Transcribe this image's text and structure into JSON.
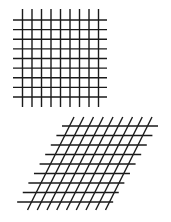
{
  "figure": {
    "panels": [
      {
        "id": "square-grid",
        "description": "orthogonal grid",
        "vertical_lines": 9,
        "horizontal_lines": 9,
        "line_color": "#1a1a1a"
      },
      {
        "id": "sheared-grid",
        "description": "sheared (slanted) grid",
        "slanted_lines": 9,
        "horizontal_lines": 9,
        "line_color": "#1a1a1a"
      }
    ]
  }
}
